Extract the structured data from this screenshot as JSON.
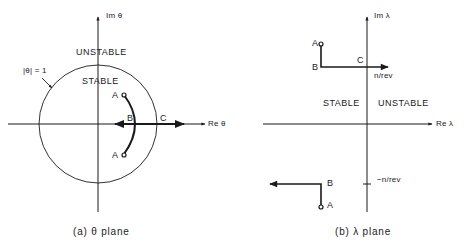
{
  "panel_a": {
    "caption": "(a)  θ plane",
    "axis_im": "Im θ",
    "axis_re": "Re θ",
    "region_outside": "UNSTABLE",
    "region_inside": "STABLE",
    "circle_label": "|θ| = 1",
    "points": {
      "a_top": "A",
      "a_bottom": "A",
      "b": "B",
      "c": "C"
    }
  },
  "panel_b": {
    "caption": "(b)  λ plane",
    "axis_im": "Im λ",
    "axis_re": "Re λ",
    "region_left": "STABLE",
    "region_right": "UNSTABLE",
    "tick_pos": "n/rev",
    "tick_neg": "−n/rev",
    "points": {
      "a_top": "A",
      "b_top": "B",
      "c": "C",
      "b_bottom": "B",
      "a_bottom": "A"
    }
  },
  "colors": {
    "ink": "#1a1a1a",
    "background": "#ffffff"
  }
}
